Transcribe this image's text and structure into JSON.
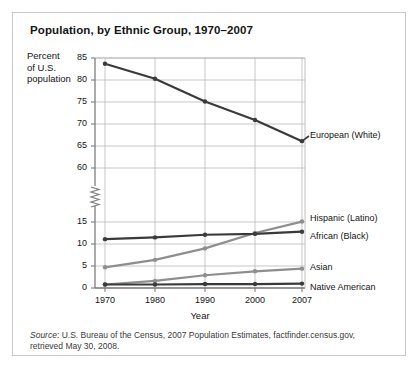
{
  "title": "Population, by Ethnic Group, 1970–2007",
  "axis": {
    "y_label_line1": "Percent",
    "y_label_line2": "of U.S.",
    "y_label_line3": "population",
    "x_label": "Year"
  },
  "source": {
    "prefix": "Source",
    "text": ": U.S. Bureau of the Census, 2007 Population Estimates, factfinder.census.gov, retrieved May 30, 2008."
  },
  "colors": {
    "dark_line": "#3a3a3a",
    "gray_line": "#8e8e8e",
    "grid": "#b9b9b9",
    "axis": "#7d7d7d",
    "frame": "#c9c9c9",
    "text": "#141414"
  },
  "chart_data": {
    "type": "line",
    "title": "Population, by Ethnic Group, 1970–2007",
    "xlabel": "Year",
    "ylabel": "Percent of U.S. population",
    "x": [
      1970,
      1980,
      1990,
      2000,
      2007
    ],
    "xticklabels": [
      "1970",
      "1980",
      "1990",
      "2000",
      "2007"
    ],
    "yticks_lower": [
      0,
      5,
      10,
      15
    ],
    "yticks_upper": [
      60,
      65,
      70,
      75,
      80,
      85
    ],
    "yticklabels": [
      "0",
      "5",
      "10",
      "15",
      "60",
      "65",
      "70",
      "75",
      "80",
      "85"
    ],
    "axis_break": true,
    "axis_break_note": "y-axis broken between 15 and 60",
    "grid": true,
    "legend_position": "right-of-plot-inline",
    "series": [
      {
        "name": "European (White)",
        "color": "#3a3a3a",
        "values": [
          83.7,
          80.3,
          75.1,
          70.9,
          66.1
        ]
      },
      {
        "name": "Hispanic (Latino)",
        "color": "#8e8e8e",
        "values": [
          4.7,
          6.4,
          9.0,
          12.5,
          15.1
        ]
      },
      {
        "name": "African (Black)",
        "color": "#3a3a3a",
        "values": [
          11.1,
          11.5,
          12.1,
          12.3,
          12.8
        ]
      },
      {
        "name": "Asian",
        "color": "#8e8e8e",
        "values": [
          0.8,
          1.6,
          2.9,
          3.8,
          4.4
        ]
      },
      {
        "name": "Native American",
        "color": "#3a3a3a",
        "values": [
          0.8,
          0.8,
          0.9,
          0.9,
          1.0
        ]
      }
    ]
  }
}
